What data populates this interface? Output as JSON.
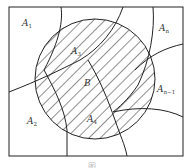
{
  "figure": {
    "type": "set-partition-diagram",
    "colors": {
      "stroke": "#222222",
      "background": "#ffffff",
      "text": "#333333"
    },
    "region_labels": [
      {
        "id": "A1",
        "base": "A",
        "sub": "1",
        "x": 22,
        "y": 26
      },
      {
        "id": "A3",
        "base": "A",
        "sub": "3",
        "x": 71,
        "y": 54
      },
      {
        "id": "An",
        "base": "A",
        "sub": "n",
        "x": 161,
        "y": 31
      },
      {
        "id": "B",
        "base": "B",
        "sub": "",
        "x": 84,
        "y": 86
      },
      {
        "id": "An-1",
        "base": "A",
        "sub": "n−1",
        "x": 158,
        "y": 92
      },
      {
        "id": "A2",
        "base": "A",
        "sub": "2",
        "x": 28,
        "y": 123
      },
      {
        "id": "A4",
        "base": "A",
        "sub": "4",
        "x": 88,
        "y": 122
      }
    ],
    "caption": "图"
  }
}
